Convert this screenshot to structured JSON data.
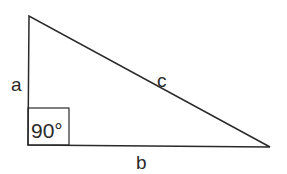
{
  "diagram": {
    "labels": {
      "side_a": "a",
      "side_b": "b",
      "side_c": "c",
      "right_angle": "90°"
    },
    "colors": {
      "stroke": "#2a2a2a",
      "background": "#ffffff"
    }
  }
}
